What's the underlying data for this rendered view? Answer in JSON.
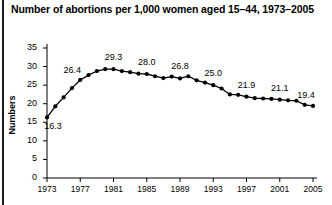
{
  "chart_data": {
    "type": "line",
    "title": "Number of abortions per 1,000 women aged 15–44, 1973–2005",
    "xlabel": "",
    "ylabel": "Numbers",
    "xlim": [
      1973,
      2005
    ],
    "ylim": [
      0,
      35
    ],
    "grid": false,
    "legend": "none",
    "marker": "filled-circle",
    "line_color": "#000000",
    "xticks": [
      "1973",
      "1977",
      "1981",
      "1985",
      "1989",
      "1993",
      "1997",
      "2001",
      "2005"
    ],
    "yticks": [
      "0",
      "5",
      "10",
      "15",
      "20",
      "25",
      "30",
      "35"
    ],
    "x": [
      1973,
      1974,
      1975,
      1976,
      1977,
      1978,
      1979,
      1980,
      1981,
      1982,
      1983,
      1984,
      1985,
      1986,
      1987,
      1988,
      1989,
      1990,
      1991,
      1992,
      1993,
      1994,
      1995,
      1996,
      1997,
      1998,
      1999,
      2000,
      2001,
      2002,
      2003,
      2004,
      2005
    ],
    "values": [
      16.3,
      19.3,
      21.7,
      24.2,
      26.4,
      27.7,
      28.8,
      29.3,
      29.3,
      28.8,
      28.5,
      28.1,
      28.0,
      27.4,
      26.9,
      27.3,
      26.8,
      27.4,
      26.3,
      25.7,
      25.0,
      24.1,
      22.5,
      22.4,
      21.9,
      21.5,
      21.4,
      21.3,
      21.1,
      20.9,
      20.8,
      19.7,
      19.4
    ],
    "annotations": [
      {
        "year": 1973,
        "value": 16.3,
        "label": "16.3"
      },
      {
        "year": 1977,
        "value": 26.4,
        "label": "26.4"
      },
      {
        "year": 1981,
        "value": 29.3,
        "label": "29.3"
      },
      {
        "year": 1985,
        "value": 28.0,
        "label": "28.0"
      },
      {
        "year": 1989,
        "value": 26.8,
        "label": "26.8"
      },
      {
        "year": 1993,
        "value": 25.0,
        "label": "25.0"
      },
      {
        "year": 1997,
        "value": 21.9,
        "label": "21.9"
      },
      {
        "year": 2001,
        "value": 21.1,
        "label": "21.1"
      },
      {
        "year": 2005,
        "value": 19.4,
        "label": "19.4"
      }
    ]
  }
}
